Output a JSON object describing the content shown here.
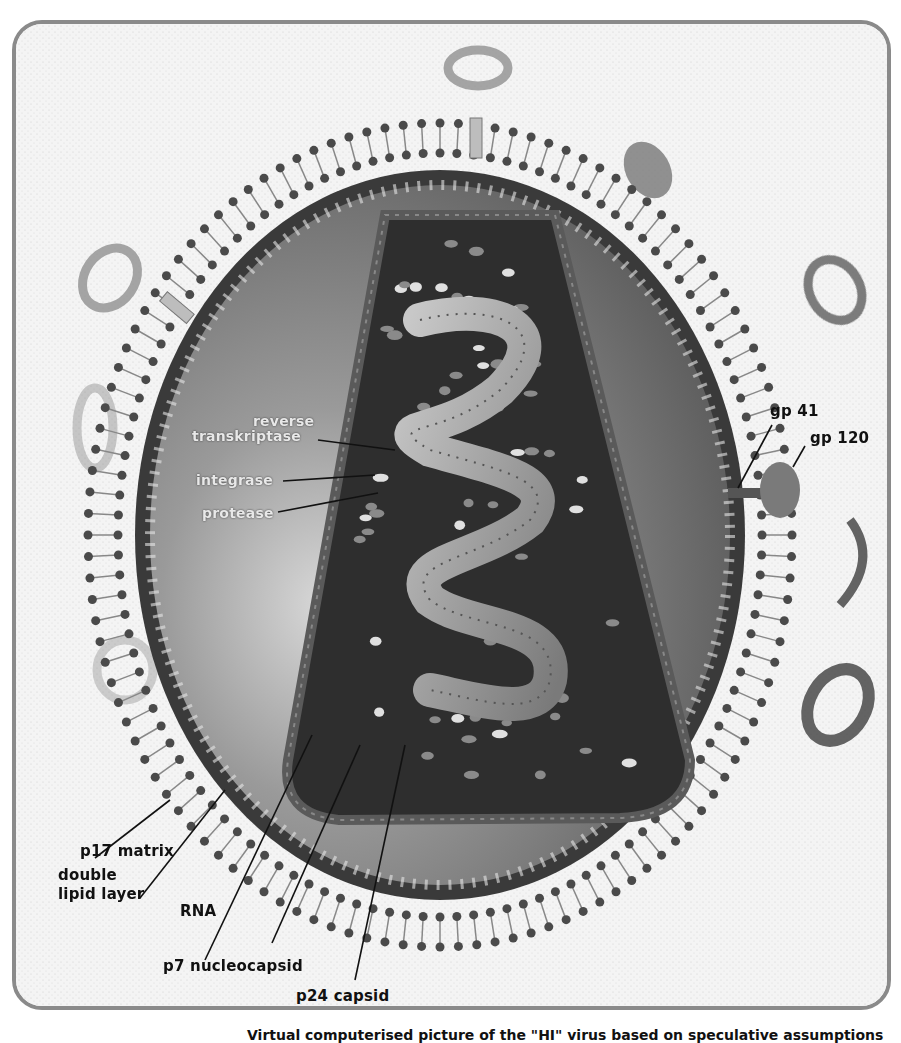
{
  "figure": {
    "labels": {
      "reverse_transkriptase_line1": "reverse",
      "reverse_transkriptase_line2": "transkriptase",
      "integrase": "integrase",
      "protease": "protease",
      "gp41": "gp 41",
      "gp120": "gp 120",
      "double_lipid_layer_line1": "double",
      "double_lipid_layer_line2": "lipid layer",
      "p17_matrix": "p17 matrix",
      "rna": "RNA",
      "p7_nucleocapsid": "p7 nucleocapsid",
      "p24_capsid": "p24 capsid"
    },
    "caption": "Virtual computerised picture of the \"HI\" virus based on speculative assumptions",
    "colors": {
      "background": "#f4f4f4",
      "frame": "#8a8a8a",
      "lipid_dot": "#4a4a4a",
      "matrix_shell": "#3a3a3a",
      "matrix_fill": "#6e6e6e",
      "capsid": "#2e2e2e",
      "rna": "#9a9a9a",
      "label_text": "#111111",
      "inner_label_text": "#e8e8e8"
    }
  }
}
